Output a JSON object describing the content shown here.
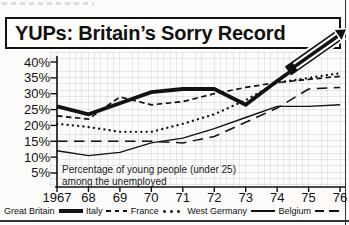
{
  "chart_data": {
    "type": "line",
    "title": "YUPs: Britain’s Sorry Record",
    "annotation": [
      "Percentage of young people (under 25)",
      "among the unemployed"
    ],
    "x_tick_labels": [
      "1967",
      "68",
      "69",
      "70",
      "71",
      "72",
      "73",
      "74",
      "75",
      "76"
    ],
    "y_tick_labels": [
      "40%",
      "35%",
      "30%",
      "25%",
      "20%",
      "15%",
      "10%",
      "5%"
    ],
    "ylim": [
      5,
      40
    ],
    "unit": "percent",
    "grid": "graph-paper",
    "legend_position": "bottom",
    "series": [
      {
        "name": "Great Britain",
        "style": "thick-solid",
        "values": [
          26,
          23.5,
          27,
          30.5,
          31.5,
          31.5,
          26.5,
          34,
          41,
          null
        ],
        "note": "1976 value off scale; line exits top of chart as an arrow breaking through the title box"
      },
      {
        "name": "Italy",
        "style": "dashed",
        "values": [
          23,
          22,
          29,
          26.5,
          27.5,
          30,
          32,
          33.5,
          34.5,
          35.5
        ]
      },
      {
        "name": "France",
        "style": "dotted",
        "values": [
          20.5,
          19.5,
          18,
          18,
          20.5,
          23.5,
          28,
          33.5,
          35,
          36.5
        ]
      },
      {
        "name": "West Germany",
        "style": "thin-solid",
        "values": [
          12,
          10.5,
          11.5,
          14.5,
          16,
          19,
          22.5,
          26,
          26,
          26.5
        ]
      },
      {
        "name": "Belgium",
        "style": "long-dash",
        "values": [
          15,
          15,
          15,
          15,
          14.5,
          16.5,
          21,
          25.5,
          31.5,
          32
        ]
      }
    ],
    "ink_color": "#111111",
    "paper_color": "#fcfbf9"
  }
}
